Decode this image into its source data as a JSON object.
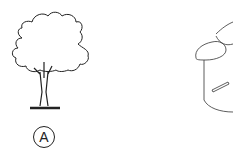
{
  "figures": [
    {
      "id": "A",
      "label": "A",
      "subject": "tree-icon"
    },
    {
      "id": "B",
      "subject": "bucket-icon"
    }
  ],
  "colors": {
    "line": "#222222",
    "background": "#ffffff"
  }
}
